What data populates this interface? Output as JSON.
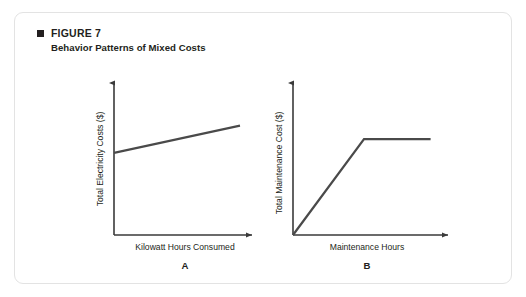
{
  "figure": {
    "bullet_icon": "filled-square-icon",
    "number_label": "FIGURE 7",
    "subtitle": "Behavior Patterns of Mixed Costs"
  },
  "colors": {
    "card_border": "#e3e3e3",
    "card_background": "#ffffff",
    "text": "#231f20",
    "axis_line": "#3a3a3a",
    "data_line": "#4a4a4a"
  },
  "chart_data": [
    {
      "type": "line",
      "title": "",
      "panel_label": "A",
      "xlabel": "Kilowatt Hours Consumed",
      "ylabel": "Total Electricity Costs ($)",
      "grid": false,
      "legend": "none",
      "xlim": [
        0,
        100
      ],
      "ylim": [
        0,
        100
      ],
      "axis_ticks": false,
      "axis_arrows": true,
      "series": [
        {
          "name": "Mixed cost (fixed base plus variable)",
          "x": [
            0,
            92
          ],
          "values": [
            54,
            72
          ]
        }
      ]
    },
    {
      "type": "line",
      "title": "",
      "panel_label": "B",
      "xlabel": "Maintenance Hours",
      "ylabel": "Total Maintenance Cost ($)",
      "grid": false,
      "legend": "none",
      "xlim": [
        0,
        100
      ],
      "ylim": [
        0,
        100
      ],
      "axis_ticks": false,
      "axis_arrows": true,
      "series": [
        {
          "name": "Mixed cost (variable then fixed)",
          "x": [
            0,
            48,
            93
          ],
          "values": [
            0,
            63,
            63
          ]
        }
      ]
    }
  ]
}
